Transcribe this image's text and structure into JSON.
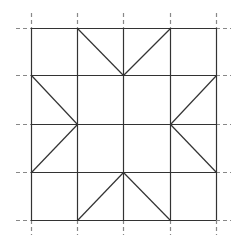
{
  "diagram": {
    "type": "quilt-block-grid",
    "rows": 4,
    "cols": 4,
    "x_lines": [
      31,
      77,
      123,
      170,
      216
    ],
    "y_lines": [
      28,
      75,
      124,
      172,
      220
    ],
    "line_color": "#333333",
    "dash_color": "#888888",
    "background": "#ffffff",
    "diagonals": [
      [
        77,
        28,
        123,
        75
      ],
      [
        170,
        28,
        123,
        75
      ],
      [
        31,
        75,
        77,
        124
      ],
      [
        216,
        75,
        170,
        124
      ],
      [
        77,
        124,
        31,
        172
      ],
      [
        170,
        124,
        216,
        172
      ],
      [
        123,
        172,
        77,
        220
      ],
      [
        123,
        172,
        170,
        220
      ]
    ],
    "extension_length": 15
  }
}
